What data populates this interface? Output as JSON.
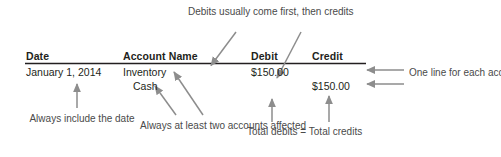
{
  "figure": {
    "background_color": "#ffffff",
    "rule_color": "#231f20",
    "arrow_color": "#8d8d8d",
    "text_color": "#231f20",
    "note_color": "#4a4a4a"
  },
  "table": {
    "headers": {
      "date": "Date",
      "account_name": "Account Name",
      "debit": "Debit",
      "credit": "Credit"
    },
    "rows": [
      {
        "date": "January 1, 2014",
        "account": "Inventory",
        "debit": "$150.00",
        "credit": ""
      },
      {
        "date": "",
        "account": "Cash",
        "debit": "",
        "credit": "$150.00"
      }
    ]
  },
  "annotations": {
    "debits_first": "Debits usually come first, then credits",
    "one_line_each": "One line for each account affected",
    "always_date": "Always include the date",
    "two_accounts": "Always at least two accounts affected",
    "totals_equal": "Total debits = Total credits"
  }
}
